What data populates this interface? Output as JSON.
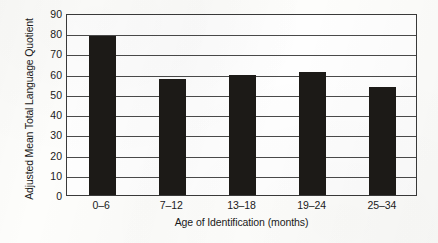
{
  "chart_data": {
    "type": "bar",
    "title": "",
    "subtitle": "",
    "xlabel": "Age of Identification (months)",
    "ylabel": "Adjusted Mean Total Language Quotient",
    "categories": [
      "0–6",
      "7–12",
      "13–18",
      "19–24",
      "25–34"
    ],
    "values": [
      78.5,
      57.5,
      59.5,
      61.0,
      53.5
    ],
    "series": [
      {
        "name": "Adjusted Mean Total Language Quotient",
        "values": [
          78.5,
          57.5,
          59.5,
          61.0,
          53.5
        ]
      }
    ],
    "ylim": [
      0,
      90
    ],
    "ytick_step": 10,
    "yticks": [
      0,
      10,
      20,
      30,
      40,
      50,
      60,
      70,
      80,
      90
    ],
    "ytick_labels": [
      "0",
      "10",
      "20",
      "30",
      "40",
      "50",
      "60",
      "70",
      "80",
      "90"
    ],
    "grid": "horizontal",
    "legend": "none",
    "bar_color": "#1c1a17",
    "axis_color": "#3a3a3a",
    "gridline_color": "#4a4a4a",
    "background_color": "#fdfdfb",
    "annotations": []
  }
}
